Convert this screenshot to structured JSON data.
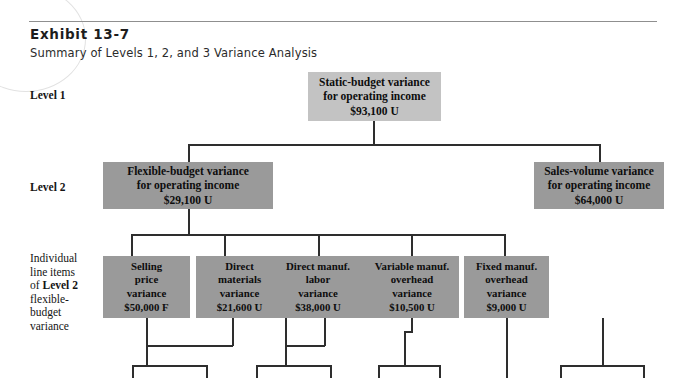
{
  "exhibit": {
    "title": "Exhibit 13-7",
    "subtitle": "Summary of Levels 1, 2, and 3 Variance Analysis"
  },
  "rail": {
    "level1_label": "Level 1",
    "level2_label": "Level 2",
    "level3_label_line1": "Individual",
    "level3_label_line2": "line items",
    "level3_label_line3_pre": "of ",
    "level3_label_line3_bold": "Level 2",
    "level3_label_line4": "flexible-",
    "level3_label_line5": "budget",
    "level3_label_line6": "variance"
  },
  "level1": {
    "box": {
      "line1": "Static-budget variance",
      "line2": "for operating income",
      "amount": "$93,100 U"
    }
  },
  "level2": {
    "flexible_budget": {
      "line1": "Flexible-budget variance",
      "line2": "for operating income",
      "amount": "$29,100 U"
    },
    "sales_volume": {
      "line1": "Sales-volume variance",
      "line2": "for operating income",
      "amount": "$64,000 U"
    }
  },
  "level3": {
    "items": [
      {
        "line1": "Selling",
        "line2": "price",
        "line3": "variance",
        "amount": "$50,000 F"
      },
      {
        "line1": "Direct",
        "line2": "materials",
        "line3": "variance",
        "amount": "$21,600 U"
      },
      {
        "line1": "Direct manuf.",
        "line2": "labor",
        "line3": "variance",
        "amount": "$38,000 U"
      },
      {
        "line1": "Variable manuf.",
        "line2": "overhead",
        "line3": "variance",
        "amount": "$10,500 U"
      },
      {
        "line1": "Fixed manuf.",
        "line2": "overhead",
        "line3": "variance",
        "amount": "$9,000 U"
      }
    ]
  },
  "colors": {
    "level1_box_fill": "#c3c3c3",
    "level2_box_fill": "#9a9a9a",
    "level3_box_fill": "#9a9a9a",
    "connector_line": "#2e2e2e",
    "header_rule": "#8f8f8f",
    "page_background": "#ffffff"
  }
}
